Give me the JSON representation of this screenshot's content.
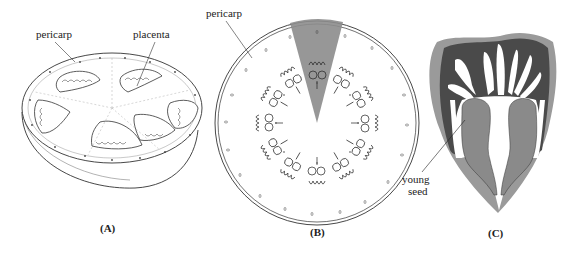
{
  "figure": {
    "panels": [
      {
        "id": "A",
        "caption": "(A)",
        "labels": {
          "pericarp": "pericarp",
          "placenta": "placenta"
        },
        "locule_count": 6
      },
      {
        "id": "B",
        "caption": "(B)",
        "labels": {
          "pericarp": "pericarp"
        },
        "highlight_wedge_color": "#8c8c8c"
      },
      {
        "id": "C",
        "caption": "(C)",
        "labels": {
          "young_seed_line1": "young",
          "young_seed_line2": "seed"
        },
        "colors": {
          "outer": "#9a9a9a",
          "tissue": "#4a4a4a",
          "seed": "#8a8a8a",
          "cavity": "#ffffff"
        }
      }
    ]
  }
}
